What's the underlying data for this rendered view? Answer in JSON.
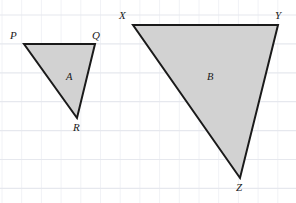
{
  "figure": {
    "type": "geometry-diagram",
    "canvas": {
      "width": 296,
      "height": 203
    },
    "background_color": "#ffffff",
    "grid": {
      "visible": true,
      "line_color": "#e6e8ee",
      "minor_line_color": "#f1f2f6",
      "cell_width": 19.7,
      "cell_height": 28.9,
      "x_offset": 2,
      "y_offset": 15
    },
    "style": {
      "fill_color": "#d2d2d2",
      "stroke_color": "#1a1a1a",
      "stroke_width": 2
    },
    "shapes": [
      {
        "name": "triangle-a",
        "region_label": "A",
        "region_label_x": 66,
        "region_label_y": 72,
        "vertices": [
          {
            "label": "P",
            "x": 24,
            "y": 44,
            "label_x": 10,
            "label_y": 30
          },
          {
            "label": "Q",
            "x": 95,
            "y": 44,
            "label_x": 92,
            "label_y": 30
          },
          {
            "label": "R",
            "x": 77,
            "y": 118,
            "label_x": 73,
            "label_y": 122
          }
        ]
      },
      {
        "name": "triangle-b",
        "region_label": "B",
        "region_label_x": 207,
        "region_label_y": 72,
        "vertices": [
          {
            "label": "X",
            "x": 133,
            "y": 25,
            "label_x": 119,
            "label_y": 10
          },
          {
            "label": "Y",
            "x": 278,
            "y": 25,
            "label_x": 275,
            "label_y": 10
          },
          {
            "label": "Z",
            "x": 240,
            "y": 178,
            "label_x": 236,
            "label_y": 182
          }
        ]
      }
    ]
  }
}
